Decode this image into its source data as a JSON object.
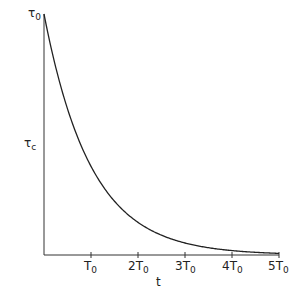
{
  "chart_data": {
    "type": "line",
    "title": "",
    "xlabel": "t",
    "ylabel": "τc",
    "y_top_label": "τ0",
    "x_tick_labels": [
      "T0",
      "2T0",
      "3T0",
      "4T0",
      "5T0"
    ],
    "x_ticks": [
      1,
      2,
      3,
      4,
      5
    ],
    "function": "tau_c = tau_0 * exp(-t/T0)",
    "x": [
      0,
      0.5,
      1,
      1.5,
      2,
      2.5,
      3,
      3.5,
      4,
      4.5,
      5
    ],
    "values": [
      1,
      0.607,
      0.368,
      0.223,
      0.135,
      0.082,
      0.05,
      0.03,
      0.018,
      0.011,
      0.007
    ],
    "xlim": [
      0,
      5
    ],
    "ylim": [
      0,
      1
    ],
    "grid": false,
    "legend": null
  },
  "labels": {
    "y_top": {
      "main": "τ",
      "sub": "0"
    },
    "y_axis": {
      "main": "τ",
      "sub": "c"
    },
    "x_axis": "t",
    "ticks": [
      {
        "pre": "",
        "main": "T",
        "sub": "0"
      },
      {
        "pre": "2",
        "main": "T",
        "sub": "0"
      },
      {
        "pre": "3",
        "main": "T",
        "sub": "0"
      },
      {
        "pre": "4",
        "main": "T",
        "sub": "0"
      },
      {
        "pre": "5",
        "main": "T",
        "sub": "0"
      }
    ]
  }
}
